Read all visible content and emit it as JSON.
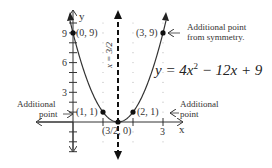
{
  "chart_data": {
    "type": "line",
    "title": "",
    "equation": "y = 4x² − 12x + 9",
    "equation_parts": {
      "prefix": "y = 4x",
      "exp": "2",
      "suffix": " − 12x + 9"
    },
    "xlabel": "x",
    "ylabel": "y",
    "xlim": [
      -1.5,
      4.5
    ],
    "ylim": [
      -4,
      11
    ],
    "grid": "dotted",
    "x_ticks": [
      {
        "value": 3,
        "label": "3"
      }
    ],
    "y_ticks": [
      {
        "value": 3,
        "label": "3"
      },
      {
        "value": 6,
        "label": "6"
      },
      {
        "value": 9,
        "label": "9"
      }
    ],
    "axis_of_symmetry": {
      "x": 1.5,
      "label": "x = 3/2",
      "style": "dashed"
    },
    "series": [
      {
        "name": "y = 4x^2 - 12x + 9",
        "x": [
          -0.1,
          0,
          0.5,
          1,
          1.5,
          2,
          2.5,
          3,
          3.1
        ],
        "y": [
          10.24,
          9,
          4,
          1,
          0,
          1,
          4,
          9,
          10.24
        ]
      }
    ],
    "points": [
      {
        "x": 0,
        "y": 9,
        "label": "(0, 9)"
      },
      {
        "x": 1,
        "y": 1,
        "label": "(1, 1)"
      },
      {
        "x": 1.5,
        "y": 0,
        "label": "(3/2, 0)"
      },
      {
        "x": 2,
        "y": 1,
        "label": "(2, 1)"
      },
      {
        "x": 3,
        "y": 9,
        "label": "(3, 9)"
      }
    ],
    "annotations": [
      {
        "text_lines": [
          "Additional point",
          "from symmetry."
        ],
        "points_to": "(3, 9)"
      },
      {
        "text_lines": [
          "Additional",
          "point"
        ],
        "points_to": "(1, 1)"
      },
      {
        "text_lines": [
          "Additional",
          "point"
        ],
        "points_to": "(2, 1)"
      }
    ]
  }
}
